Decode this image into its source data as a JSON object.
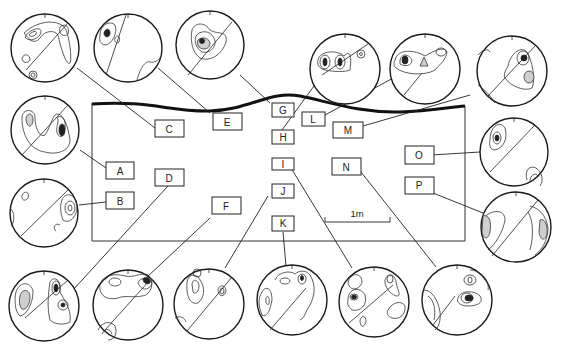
{
  "figure": {
    "type": "outcrop sketch with stereonet plots",
    "scale_bar": {
      "label": "1m"
    },
    "colors": {
      "ink": "#222222",
      "stipple": "#cfcfcf",
      "background": "#ffffff"
    }
  },
  "stations": [
    {
      "id": "A",
      "label": "A"
    },
    {
      "id": "B",
      "label": "B"
    },
    {
      "id": "C",
      "label": "C"
    },
    {
      "id": "D",
      "label": "D"
    },
    {
      "id": "E",
      "label": "E"
    },
    {
      "id": "F",
      "label": "F"
    },
    {
      "id": "G",
      "label": "G"
    },
    {
      "id": "H",
      "label": "H"
    },
    {
      "id": "I",
      "label": "I"
    },
    {
      "id": "J",
      "label": "J"
    },
    {
      "id": "K",
      "label": "K"
    },
    {
      "id": "L",
      "label": "L"
    },
    {
      "id": "M",
      "label": "M"
    },
    {
      "id": "N",
      "label": "N"
    },
    {
      "id": "O",
      "label": "O"
    },
    {
      "id": "P",
      "label": "P"
    }
  ]
}
